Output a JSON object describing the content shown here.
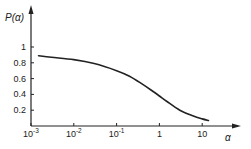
{
  "chart_data": {
    "type": "line",
    "title": "",
    "xlabel": "α",
    "ylabel": "P(α)",
    "xscale": "log",
    "xlim": [
      0.001,
      30
    ],
    "ylim": [
      0,
      1.05
    ],
    "grid": false,
    "legend": "none",
    "xticks": [
      {
        "value": 0.001,
        "base": "10",
        "exp": "-3"
      },
      {
        "value": 0.01,
        "base": "10",
        "exp": "-2"
      },
      {
        "value": 0.1,
        "base": "10",
        "exp": "-1"
      },
      {
        "value": 1,
        "base": "1",
        "exp": ""
      },
      {
        "value": 10,
        "base": "10",
        "exp": ""
      }
    ],
    "yticks": [
      {
        "value": 0.2,
        "label": "0.2"
      },
      {
        "value": 0.4,
        "label": "0.4"
      },
      {
        "value": 0.6,
        "label": "0.6"
      },
      {
        "value": 0.8,
        "label": "0.8"
      },
      {
        "value": 1.0,
        "label": "1"
      }
    ],
    "series": [
      {
        "name": "P(α)",
        "color": "#222222",
        "x": [
          0.0015,
          0.003,
          0.01,
          0.03,
          0.1,
          0.2,
          0.4,
          0.7,
          1,
          1.5,
          3,
          6,
          10,
          14
        ],
        "y": [
          0.89,
          0.87,
          0.84,
          0.79,
          0.7,
          0.63,
          0.53,
          0.44,
          0.38,
          0.31,
          0.2,
          0.13,
          0.09,
          0.07
        ]
      }
    ]
  }
}
